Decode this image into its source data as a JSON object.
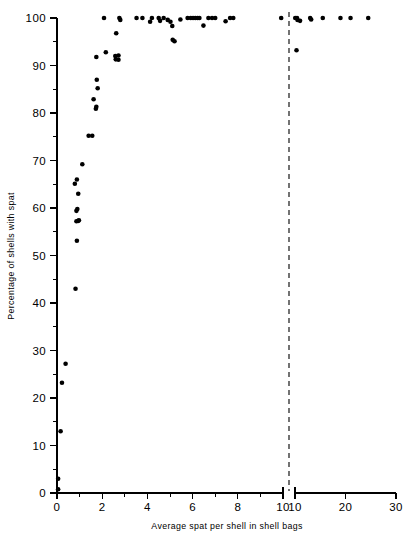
{
  "figure": {
    "kind": "scatter-plot",
    "background_color": "#ffffff",
    "ink_color": "#000000"
  },
  "chart_data": {
    "type": "scatter",
    "title": "",
    "subtitle": "",
    "xlabel": "Average  spat  per  shell in shell bags",
    "ylabel": "Percentage of shells with spat",
    "grid": false,
    "legend": null,
    "marker": {
      "shape": "circle",
      "color": "#000000",
      "size_px": 4.6
    },
    "axes_note": "x-axis is broken: linear 0-10 segment, then a compressed 10-30 segment after a dashed break line",
    "xaxis": {
      "broken": true,
      "segments": [
        {
          "min": 0,
          "max": 10,
          "ticks": [
            0,
            2,
            4,
            6,
            8,
            10
          ],
          "minor_ticks": [
            1,
            3,
            5,
            7,
            9
          ]
        },
        {
          "min": 10,
          "max": 30,
          "ticks": [
            10,
            20,
            30
          ],
          "minor_ticks": []
        }
      ],
      "tick_labels": [
        "0",
        "2",
        "4",
        "6",
        "8",
        "10",
        "10",
        "20",
        "30"
      ]
    },
    "yaxis": {
      "ylim": [
        0,
        100
      ],
      "ticks": [
        0,
        10,
        20,
        30,
        40,
        50,
        60,
        70,
        80,
        90,
        100
      ],
      "minor_ticks": [
        5,
        15,
        25,
        35,
        45,
        55,
        65,
        75,
        85,
        95
      ],
      "tick_labels": [
        "0",
        "10",
        "20",
        "30",
        "40",
        "50",
        "60",
        "70",
        "80",
        "90",
        "100"
      ]
    },
    "break_marker": {
      "type": "dashed-vertical-line",
      "at_x_value": 10
    },
    "points": [
      {
        "x": 0.05,
        "y": 0.8
      },
      {
        "x": 0.05,
        "y": 3.0
      },
      {
        "x": 0.16,
        "y": 13.0
      },
      {
        "x": 0.22,
        "y": 23.2
      },
      {
        "x": 0.38,
        "y": 27.2
      },
      {
        "x": 0.82,
        "y": 43.0
      },
      {
        "x": 0.88,
        "y": 53.1
      },
      {
        "x": 0.86,
        "y": 57.2
      },
      {
        "x": 0.94,
        "y": 57.3
      },
      {
        "x": 0.97,
        "y": 57.4
      },
      {
        "x": 0.86,
        "y": 59.4
      },
      {
        "x": 0.9,
        "y": 59.8
      },
      {
        "x": 0.94,
        "y": 63.0
      },
      {
        "x": 0.79,
        "y": 65.1
      },
      {
        "x": 0.88,
        "y": 66.0
      },
      {
        "x": 1.12,
        "y": 69.2
      },
      {
        "x": 1.4,
        "y": 75.2
      },
      {
        "x": 1.56,
        "y": 75.2
      },
      {
        "x": 1.72,
        "y": 80.9
      },
      {
        "x": 1.74,
        "y": 81.3
      },
      {
        "x": 1.62,
        "y": 82.9
      },
      {
        "x": 1.8,
        "y": 85.2
      },
      {
        "x": 1.76,
        "y": 87.0
      },
      {
        "x": 1.74,
        "y": 91.8
      },
      {
        "x": 2.16,
        "y": 92.8
      },
      {
        "x": 2.6,
        "y": 91.3
      },
      {
        "x": 2.72,
        "y": 91.2
      },
      {
        "x": 2.58,
        "y": 92.0
      },
      {
        "x": 2.72,
        "y": 92.1
      },
      {
        "x": 2.62,
        "y": 96.8
      },
      {
        "x": 2.08,
        "y": 100.0
      },
      {
        "x": 2.76,
        "y": 100.0
      },
      {
        "x": 2.8,
        "y": 99.6
      },
      {
        "x": 3.52,
        "y": 100.0
      },
      {
        "x": 3.78,
        "y": 100.0
      },
      {
        "x": 4.12,
        "y": 99.2
      },
      {
        "x": 4.2,
        "y": 100.0
      },
      {
        "x": 4.5,
        "y": 100.0
      },
      {
        "x": 4.56,
        "y": 99.4
      },
      {
        "x": 4.72,
        "y": 100.0
      },
      {
        "x": 4.9,
        "y": 99.6
      },
      {
        "x": 5.02,
        "y": 99.2
      },
      {
        "x": 5.1,
        "y": 98.3
      },
      {
        "x": 5.12,
        "y": 95.4
      },
      {
        "x": 5.2,
        "y": 95.1
      },
      {
        "x": 5.46,
        "y": 99.7
      },
      {
        "x": 5.78,
        "y": 100.0
      },
      {
        "x": 5.92,
        "y": 100.0
      },
      {
        "x": 6.02,
        "y": 100.0
      },
      {
        "x": 6.12,
        "y": 100.0
      },
      {
        "x": 6.22,
        "y": 100.0
      },
      {
        "x": 6.3,
        "y": 100.0
      },
      {
        "x": 6.48,
        "y": 98.4
      },
      {
        "x": 6.7,
        "y": 100.0
      },
      {
        "x": 6.86,
        "y": 100.0
      },
      {
        "x": 7.0,
        "y": 100.0
      },
      {
        "x": 7.46,
        "y": 99.3
      },
      {
        "x": 7.66,
        "y": 100.0
      },
      {
        "x": 7.8,
        "y": 100.0
      },
      {
        "x": 9.92,
        "y": 100.0
      },
      {
        "x": 10.05,
        "y": 100.0
      },
      {
        "x": 10.4,
        "y": 100.0
      },
      {
        "x": 10.5,
        "y": 99.6
      },
      {
        "x": 11.0,
        "y": 99.4
      },
      {
        "x": 10.3,
        "y": 93.2
      },
      {
        "x": 13.0,
        "y": 100.0
      },
      {
        "x": 13.2,
        "y": 99.7
      },
      {
        "x": 15.5,
        "y": 100.0
      },
      {
        "x": 19.0,
        "y": 100.0
      },
      {
        "x": 21.0,
        "y": 100.0
      },
      {
        "x": 24.5,
        "y": 100.0
      }
    ]
  }
}
